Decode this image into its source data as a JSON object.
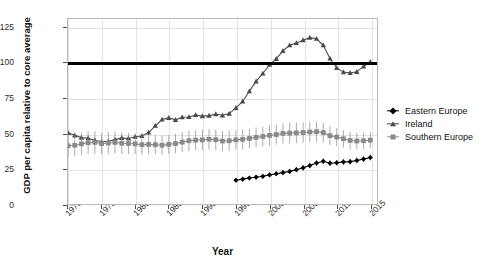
{
  "chart_data": {
    "type": "line",
    "title": "",
    "xlabel": "Year",
    "ylabel": "GDP per capita relative to core average",
    "xlim": [
      1970,
      2016
    ],
    "ylim": [
      0,
      131
    ],
    "grid": true,
    "legend_position": "right",
    "x_ticks": [
      "1970",
      "1975",
      "1980",
      "1985",
      "1990",
      "1995",
      "2000",
      "2005",
      "2010",
      "2015"
    ],
    "x_tick_values": [
      1970,
      1975,
      1980,
      1985,
      1990,
      1995,
      2000,
      2005,
      2010,
      2015
    ],
    "y_ticks": [
      "0",
      "25",
      "50",
      "75",
      "100",
      "125"
    ],
    "y_tick_values": [
      0,
      25,
      50,
      75,
      100,
      125
    ],
    "reference_line": {
      "value": 100,
      "color": "#000000",
      "label": ""
    },
    "series": [
      {
        "name": "Eastern Europe",
        "color": "#000000",
        "marker": "diamond",
        "x": [
          1995,
          1996,
          1997,
          1998,
          1999,
          2000,
          2001,
          2002,
          2003,
          2004,
          2005,
          2006,
          2007,
          2008,
          2009,
          2010,
          2011,
          2012,
          2013,
          2014,
          2015
        ],
        "values": [
          16.8,
          17.6,
          18.4,
          19.0,
          19.6,
          20.6,
          21.4,
          22.2,
          23.1,
          24.3,
          25.6,
          27.2,
          29.0,
          30.3,
          28.9,
          29.2,
          29.8,
          30.0,
          30.8,
          31.8,
          32.9
        ],
        "errors": [
          1.4,
          1.4,
          1.5,
          1.5,
          1.5,
          1.6,
          1.6,
          1.6,
          1.7,
          1.7,
          1.8,
          1.8,
          1.9,
          2.0,
          1.9,
          1.9,
          1.9,
          1.9,
          2.0,
          2.0,
          2.1
        ]
      },
      {
        "name": "Ireland",
        "color": "#4a4a4a",
        "marker": "triangle",
        "x": [
          1970,
          1971,
          1972,
          1973,
          1974,
          1975,
          1976,
          1977,
          1978,
          1979,
          1980,
          1981,
          1982,
          1983,
          1984,
          1985,
          1986,
          1987,
          1988,
          1989,
          1990,
          1991,
          1992,
          1993,
          1994,
          1995,
          1996,
          1997,
          1998,
          1999,
          2000,
          2001,
          2002,
          2003,
          2004,
          2005,
          2006,
          2007,
          2008,
          2009,
          2010,
          2011,
          2012,
          2013,
          2014,
          2015
        ],
        "values": [
          50.4,
          48.6,
          47.0,
          46.6,
          45.2,
          44.0,
          44.4,
          45.6,
          46.8,
          46.4,
          47.6,
          48.2,
          50.6,
          55.4,
          59.8,
          61.0,
          59.6,
          61.4,
          61.6,
          63.0,
          62.2,
          62.6,
          63.6,
          62.8,
          64.0,
          68.0,
          72.6,
          79.8,
          86.8,
          92.4,
          98.6,
          102.8,
          108.4,
          112.4,
          114.0,
          116.0,
          117.8,
          117.0,
          112.4,
          103.0,
          96.4,
          93.4,
          92.8,
          93.6,
          97.4,
          100.6
        ],
        "errors": [
          0,
          0,
          0,
          0,
          0,
          0,
          0,
          0,
          0,
          0,
          0,
          0,
          0,
          0,
          0,
          0,
          0,
          0,
          0,
          0,
          0,
          0,
          0,
          0,
          0,
          0,
          0,
          0,
          0,
          0,
          0,
          0,
          0,
          0,
          0,
          0,
          0,
          0,
          0,
          0,
          0,
          0,
          0,
          0,
          0,
          0
        ]
      },
      {
        "name": "Southern Europe",
        "color": "#8a8a8a",
        "marker": "square",
        "x": [
          1970,
          1971,
          1972,
          1973,
          1974,
          1975,
          1976,
          1977,
          1978,
          1979,
          1980,
          1981,
          1982,
          1983,
          1984,
          1985,
          1986,
          1987,
          1988,
          1989,
          1990,
          1991,
          1992,
          1993,
          1994,
          1995,
          1996,
          1997,
          1998,
          1999,
          2000,
          2001,
          2002,
          2003,
          2004,
          2005,
          2006,
          2007,
          2008,
          2009,
          2010,
          2011,
          2012,
          2013,
          2014,
          2015
        ],
        "values": [
          41.2,
          41.6,
          42.6,
          43.4,
          43.6,
          42.8,
          43.2,
          43.6,
          43.0,
          42.8,
          42.6,
          42.0,
          42.2,
          42.0,
          41.6,
          42.2,
          42.8,
          43.8,
          44.8,
          45.2,
          45.4,
          45.8,
          45.6,
          44.6,
          44.8,
          45.4,
          45.8,
          46.4,
          47.2,
          47.8,
          48.6,
          49.2,
          50.0,
          50.2,
          50.4,
          50.6,
          51.0,
          51.2,
          50.6,
          48.4,
          47.4,
          46.2,
          45.0,
          44.6,
          44.8,
          45.2
        ],
        "errors": [
          7.8,
          7.6,
          7.8,
          8.0,
          8.0,
          7.6,
          7.6,
          7.8,
          7.6,
          7.4,
          7.2,
          7.0,
          7.0,
          6.8,
          6.8,
          6.8,
          6.8,
          7.0,
          7.2,
          7.2,
          7.2,
          7.4,
          7.2,
          7.0,
          7.0,
          7.0,
          7.0,
          7.0,
          7.0,
          7.0,
          7.2,
          7.2,
          7.2,
          7.2,
          7.2,
          7.2,
          7.2,
          7.2,
          7.0,
          6.6,
          6.4,
          6.2,
          6.0,
          5.8,
          5.8,
          5.8
        ]
      }
    ]
  },
  "legend": {
    "entries": [
      {
        "label": "Eastern Europe",
        "marker": "diamond",
        "color": "#000000"
      },
      {
        "label": "Ireland",
        "marker": "triangle",
        "color": "#4a4a4a"
      },
      {
        "label": "Southern Europe",
        "marker": "square",
        "color": "#8a8a8a"
      }
    ]
  }
}
